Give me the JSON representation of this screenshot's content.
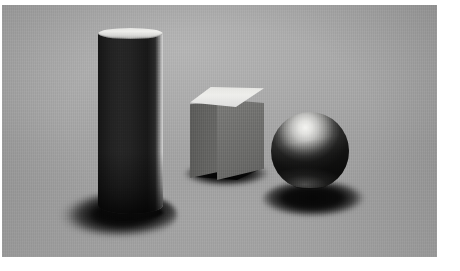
{
  "image": {
    "title": "Three geometric primitives on a gray studio backdrop",
    "medium": "3D render / studio photograph",
    "width": 460,
    "height": 271,
    "plate": {
      "left": 2,
      "top": 5,
      "width": 435,
      "height": 252,
      "border_color": "#ffffff"
    },
    "background": {
      "name": "seamless gray backdrop",
      "base_color": "#a0a0a0",
      "highlight_color": "#b4b4b4",
      "shade_color": "#8e8e8e",
      "floor_color": "#b0b0b0",
      "texture": "fine vertical scan grain"
    },
    "lighting": {
      "key_light_direction": "upper left, slightly front",
      "shadow_direction": "down and to the right",
      "shadow_color": "#0a0a0a",
      "contrast": "high"
    }
  },
  "objects": [
    {
      "name": "cylinder",
      "shape": "cylinder",
      "surface": "matte dark charcoal",
      "body_color": "#222222",
      "top_cap_color": "#f0f0ed",
      "rim_light_color": "#cfcfcf",
      "position": {
        "x": 98,
        "y": 28,
        "width": 65,
        "height": 191
      },
      "shadow": {
        "x": 42,
        "y": 192,
        "width": 135,
        "height": 52,
        "color": "#080808"
      },
      "notes": "tall upright cylinder, bright elliptical top cap, bright specular rim on right edge, deep cast shadow pooling to the lower left"
    },
    {
      "name": "cube",
      "shape": "cube",
      "surface": "matte mid gray",
      "top_face_color": "#ececea",
      "left_face_color": "#626260",
      "right_face_color": "#727270",
      "position": {
        "x": 188,
        "y": 82,
        "width": 74,
        "height": 93
      },
      "shadow": {
        "x": 182,
        "y": 163,
        "width": 92,
        "height": 26,
        "color": "#101010"
      },
      "notes": "center cube seen from slightly above, brightly lit top face, two visible side faces in mid gray, compact shadow hugging the base"
    },
    {
      "name": "sphere",
      "shape": "sphere",
      "surface": "matte light gray",
      "highlight_color": "#f4f4f1",
      "midtone_color": "#8f8f8d",
      "shade_color": "#1d1d1c",
      "position": {
        "x": 271,
        "y": 112,
        "width": 78,
        "height": 78
      },
      "shadow": {
        "x": 262,
        "y": 180,
        "width": 112,
        "height": 40,
        "color": "#0b0b0b"
      },
      "notes": "sphere at right, strong highlight at upper left of the ball falling off to a dark lower hemisphere, elliptical shadow stretching right"
    }
  ]
}
